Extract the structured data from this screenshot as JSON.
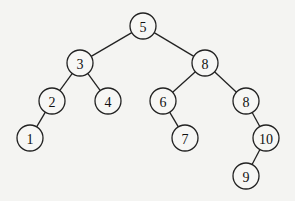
{
  "diagram": {
    "type": "binary-tree",
    "node_radius": 13,
    "nodes": [
      {
        "id": "n5",
        "label": "5",
        "x": 143,
        "y": 26
      },
      {
        "id": "n3",
        "label": "3",
        "x": 80,
        "y": 63
      },
      {
        "id": "n8a",
        "label": "8",
        "x": 205,
        "y": 63
      },
      {
        "id": "n2",
        "label": "2",
        "x": 52,
        "y": 101
      },
      {
        "id": "n4",
        "label": "4",
        "x": 108,
        "y": 101
      },
      {
        "id": "n6",
        "label": "6",
        "x": 163,
        "y": 101
      },
      {
        "id": "n8b",
        "label": "8",
        "x": 246,
        "y": 101
      },
      {
        "id": "n1",
        "label": "1",
        "x": 30,
        "y": 138
      },
      {
        "id": "n7",
        "label": "7",
        "x": 185,
        "y": 138
      },
      {
        "id": "n10",
        "label": "10",
        "x": 266,
        "y": 138
      },
      {
        "id": "n9",
        "label": "9",
        "x": 246,
        "y": 176
      }
    ],
    "edges": [
      [
        "n5",
        "n3"
      ],
      [
        "n5",
        "n8a"
      ],
      [
        "n3",
        "n2"
      ],
      [
        "n3",
        "n4"
      ],
      [
        "n8a",
        "n6"
      ],
      [
        "n8a",
        "n8b"
      ],
      [
        "n2",
        "n1"
      ],
      [
        "n6",
        "n7"
      ],
      [
        "n8b",
        "n10"
      ],
      [
        "n10",
        "n9"
      ]
    ]
  }
}
